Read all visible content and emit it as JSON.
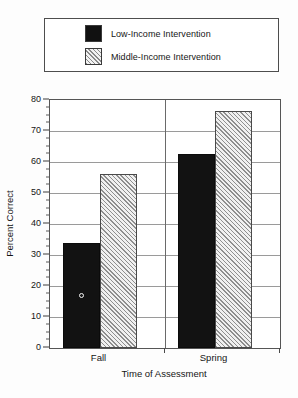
{
  "chart_data": {
    "type": "bar",
    "title": "",
    "xlabel": "Time of Assessment",
    "ylabel": "Percent Correct",
    "categories": [
      "Fall",
      "Spring"
    ],
    "series": [
      {
        "name": "Low-Income Intervention",
        "values": [
          34,
          62.5
        ],
        "fill": "solid-black",
        "color": "#121212"
      },
      {
        "name": "Middle-Income Intervention",
        "values": [
          56,
          76.5
        ],
        "fill": "diagonal-hatch",
        "color": "#f0f0f0"
      }
    ],
    "ylim": [
      0,
      80
    ],
    "y_major_ticks": [
      0,
      10,
      20,
      30,
      40,
      50,
      60,
      70,
      80
    ],
    "y_minor_tick_interval": 2.5,
    "y_tick_labels": [
      "0",
      "10",
      "20",
      "30",
      "40",
      "50",
      "60",
      "70",
      "80"
    ],
    "grid": true,
    "grid_axis": "y",
    "legend_position": "top",
    "annotations": [
      {
        "name": "open-circle-marker",
        "group": "Fall",
        "series": "Low-Income Intervention",
        "y": 17
      }
    ]
  },
  "legend": {
    "entries": [
      {
        "label": "Low-Income Intervention",
        "swatch": "solid-black-swatch"
      },
      {
        "label": "Middle-Income Intervention",
        "swatch": "hatched-swatch"
      }
    ]
  },
  "axes": {
    "y": {
      "title": "Percent Correct",
      "ticks": [
        "80",
        "70",
        "60",
        "50",
        "40",
        "30",
        "20",
        "10",
        "0"
      ]
    },
    "x": {
      "title": "Time of Assessment",
      "ticks": [
        "Fall",
        "Spring"
      ]
    }
  },
  "colors": {
    "bar_low_income": "#121212",
    "bar_middle_income": "#f0f0f0",
    "hatch_stroke": "#8e8e8e",
    "axis": "#555555",
    "gridline": "#9a9a9a",
    "text": "#151515",
    "background": "#ffffff"
  }
}
